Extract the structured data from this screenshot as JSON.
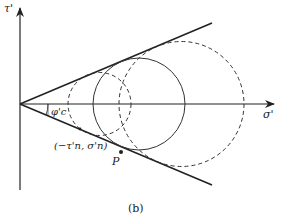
{
  "diagram": {
    "type": "mohr-circles-envelope",
    "axes": {
      "x_label": "σ'",
      "y_label": "τ'"
    },
    "angle_label": "φ'c",
    "point_label": "(−τ'n, σ'n)",
    "tangent_point": "P",
    "caption": "(b)",
    "circles": [
      {
        "style": "dashed",
        "center_x": 99.5,
        "radius": 31.5
      },
      {
        "style": "solid",
        "center_x": 139,
        "radius": 46
      },
      {
        "style": "dashed",
        "center_x": 181.5,
        "radius": 62.5
      }
    ],
    "colors": {
      "stroke": "#222222",
      "background": "#ffffff"
    }
  }
}
